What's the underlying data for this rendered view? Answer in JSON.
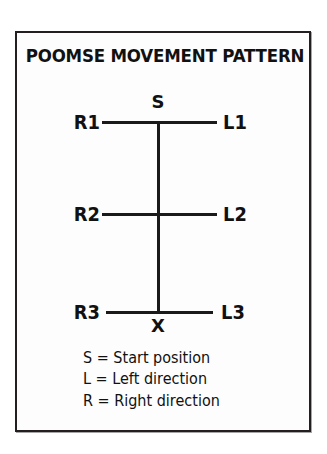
{
  "card": {
    "title": "POOMSE MOVEMENT PATTERN"
  },
  "diagram": {
    "type": "movement-pattern",
    "rows": [
      {
        "left_label": "R1",
        "right_label": "L1"
      },
      {
        "left_label": "R2",
        "right_label": "L2"
      },
      {
        "left_label": "R3",
        "right_label": "L3"
      }
    ],
    "markers": {
      "start": "S",
      "end": "X"
    }
  },
  "legend": {
    "items": [
      "S = Start position",
      "L = Left direction",
      "R = Right direction"
    ]
  },
  "colors": {
    "ink": "#111111",
    "line": "#1a1a1a",
    "border": "#231f20",
    "paper": "#fdfdfd"
  }
}
